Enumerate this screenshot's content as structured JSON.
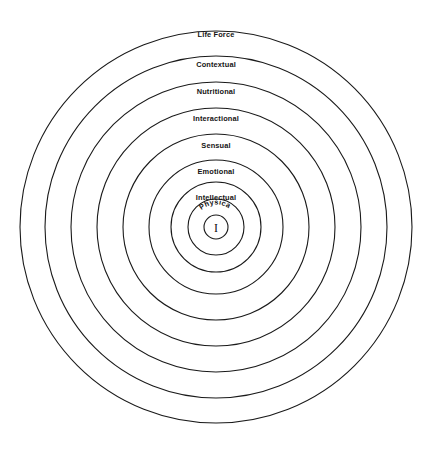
{
  "diagram": {
    "background_color": "#ffffff",
    "stroke_color": "#1a1a1a",
    "center": {
      "x": 216,
      "y": 227
    },
    "core_label": "I",
    "curved_label": "Physical",
    "rings": [
      {
        "label": "Life Force",
        "radius": 196,
        "label_y": 37
      },
      {
        "label": "Contextual",
        "radius": 171,
        "label_y": 67
      },
      {
        "label": "Nutritional",
        "radius": 145,
        "label_y": 94
      },
      {
        "label": "Interactional",
        "radius": 119,
        "label_y": 121
      },
      {
        "label": "Sensual",
        "radius": 93,
        "label_y": 148
      },
      {
        "label": "Emotional",
        "radius": 67,
        "label_y": 174
      },
      {
        "label": "Intellectual",
        "radius": 45,
        "label_y": 200
      },
      {
        "label": "Physical",
        "radius": 28,
        "label_y": 0
      },
      {
        "label": "I",
        "radius": 12,
        "label_y": 0
      }
    ]
  },
  "chart_data": {
    "type": "pie",
    "subtitle": "",
    "xlabel": "",
    "ylabel": "",
    "legend_position": "none",
    "grid": false,
    "categories": [
      "Life Force",
      "Contextual",
      "Nutritional",
      "Interactional",
      "Sensual",
      "Emotional",
      "Intellectual",
      "Physical",
      "I"
    ],
    "values": [
      196,
      171,
      145,
      119,
      93,
      67,
      45,
      28,
      12
    ],
    "annotations": [
      "Life Force",
      "Contextual",
      "Nutritional",
      "Interactional",
      "Sensual",
      "Emotional",
      "Intellectual",
      "Physical",
      "I"
    ]
  }
}
